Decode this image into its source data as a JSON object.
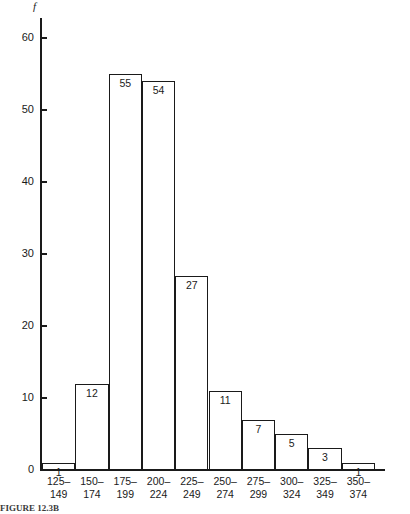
{
  "chart_data": {
    "type": "bar",
    "title": "",
    "xlabel": "",
    "ylabel": "f",
    "categories": [
      "125–149",
      "150–174",
      "175–199",
      "200–224",
      "225–249",
      "250–274",
      "275–299",
      "300–324",
      "325–349",
      "350–374"
    ],
    "category_lines": [
      [
        "125–",
        "149"
      ],
      [
        "150–",
        "174"
      ],
      [
        "175–",
        "199"
      ],
      [
        "200–",
        "224"
      ],
      [
        "225–",
        "249"
      ],
      [
        "250–",
        "274"
      ],
      [
        "275–",
        "299"
      ],
      [
        "300–",
        "324"
      ],
      [
        "325–",
        "349"
      ],
      [
        "350–",
        "374"
      ]
    ],
    "values": [
      1,
      12,
      55,
      54,
      27,
      11,
      7,
      5,
      3,
      1
    ],
    "data_labels": [
      "1",
      "12",
      "55",
      "54",
      "27",
      "11",
      "7",
      "5",
      "3",
      "1"
    ],
    "ylim": [
      0,
      62
    ],
    "yticks": [
      0,
      10,
      20,
      30,
      40,
      50,
      60
    ],
    "ytick_labels": [
      "0",
      "10",
      "20",
      "30",
      "40",
      "50",
      "60"
    ],
    "grid": false,
    "legend": false,
    "bar_fill_color": "#ffffff",
    "bar_edge_color": "#1a1a1a",
    "axis_color": "#1a1a1a"
  },
  "caption": {
    "text": "FIGURE 12.3B"
  }
}
